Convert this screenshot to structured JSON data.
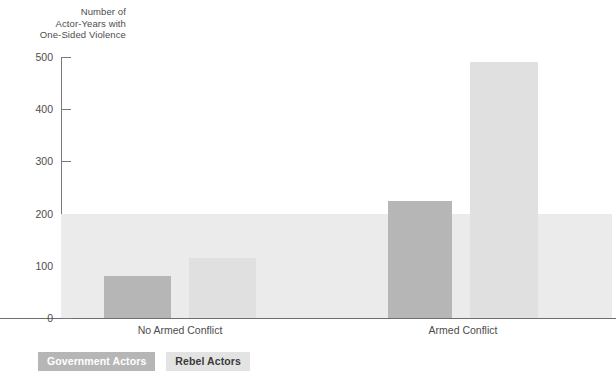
{
  "chart_data": {
    "type": "bar",
    "title": "Number of\nActor-Years with\nOne-Sided Violence",
    "ylabel": "Number of Actor-Years with One-Sided Violence",
    "xlabel": "",
    "categories": [
      "No Armed Conflict",
      "Armed Conflict"
    ],
    "series": [
      {
        "name": "Government Actors",
        "values": [
          80,
          225
        ],
        "color": "#b6b6b6"
      },
      {
        "name": "Rebel Actors",
        "values": [
          115,
          490
        ],
        "color": "#e0e0e0"
      }
    ],
    "ylim": [
      0,
      500
    ],
    "yticks": [
      0,
      100,
      200,
      300,
      400,
      500
    ],
    "ytick_labels": [
      "0",
      "100",
      "200",
      "300",
      "400",
      "500"
    ],
    "grid": false,
    "legend_position": "bottom-left",
    "shaded_band": {
      "from": 0,
      "to": 200,
      "color": "#ebebeb"
    }
  },
  "axis": {
    "title_text": "Number of\nActor-Years with\nOne-Sided Violence",
    "ticks": [
      {
        "label": "500",
        "value": 500
      },
      {
        "label": "400",
        "value": 400
      },
      {
        "label": "300",
        "value": 300
      },
      {
        "label": "200",
        "value": 200
      },
      {
        "label": "100",
        "value": 100
      },
      {
        "label": "0",
        "value": 0
      }
    ]
  },
  "categories": [
    {
      "label": "No Armed Conflict"
    },
    {
      "label": "Armed Conflict"
    }
  ],
  "bars": [
    {
      "name": "no-conflict-government",
      "series": "Government Actors",
      "category": "No Armed Conflict",
      "value": 80
    },
    {
      "name": "no-conflict-rebel",
      "series": "Rebel Actors",
      "category": "No Armed Conflict",
      "value": 115
    },
    {
      "name": "armed-conflict-government",
      "series": "Government Actors",
      "category": "Armed Conflict",
      "value": 225
    },
    {
      "name": "armed-conflict-rebel",
      "series": "Rebel Actors",
      "category": "Armed Conflict",
      "value": 490
    }
  ],
  "legend": {
    "items": [
      {
        "label": "Government Actors",
        "color": "#b6b6b6"
      },
      {
        "label": "Rebel Actors",
        "color": "#e0e0e0"
      }
    ]
  }
}
